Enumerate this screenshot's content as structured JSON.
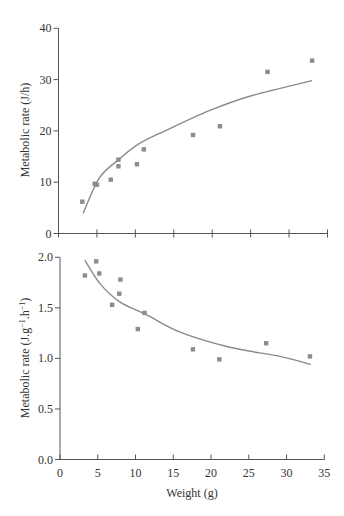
{
  "colors": {
    "axis": "#555555",
    "marker": "#8c8c8c",
    "curve": "#8a8a8a",
    "text": "#333333"
  },
  "chart_data": [
    {
      "type": "scatter",
      "panel": "top",
      "title": "",
      "xlabel": "",
      "ylabel": "Metabolic rate (J/h)",
      "xlim": [
        0,
        35
      ],
      "ylim": [
        0,
        40
      ],
      "xticks": [
        0,
        5,
        10,
        15,
        20,
        25,
        30,
        35
      ],
      "xtick_labels_shown": false,
      "yticks": [
        0,
        10,
        20,
        30,
        40
      ],
      "ytick_labels": [
        "0",
        "10",
        "20",
        "30",
        "40"
      ],
      "grid": false,
      "legend": null,
      "series": [
        {
          "name": "observed",
          "kind": "points",
          "x": [
            3.1,
            4.7,
            5.0,
            6.8,
            7.8,
            7.8,
            10.2,
            11.1,
            17.5,
            21.0,
            27.2,
            33.0
          ],
          "y": [
            6.2,
            9.7,
            9.5,
            10.5,
            14.4,
            13.1,
            13.5,
            16.4,
            19.2,
            20.9,
            31.5,
            33.7
          ]
        },
        {
          "name": "fitted curve",
          "kind": "line",
          "x": [
            3.2,
            5.3,
            7.9,
            10.5,
            14.0,
            19.7,
            25.0,
            33.0
          ],
          "y": [
            3.9,
            10.8,
            14.5,
            17.5,
            20.1,
            24.0,
            26.8,
            29.8
          ]
        }
      ]
    },
    {
      "type": "scatter",
      "panel": "bottom",
      "title": "",
      "xlabel": "Weight (g)",
      "ylabel": "Metabolic rate (J.g⁻¹.h⁻¹)",
      "ylabel_parts": {
        "pre": "Metabolic rate (J.g",
        "sup1": "−1",
        "mid": ".h",
        "sup2": "−1",
        "post": ")"
      },
      "xlim": [
        0,
        35
      ],
      "ylim": [
        0.0,
        2.0
      ],
      "xticks": [
        0,
        5,
        10,
        15,
        20,
        25,
        30,
        35
      ],
      "xtick_labels": [
        "0",
        "5",
        "10",
        "15",
        "20",
        "25",
        "30",
        "35"
      ],
      "yticks": [
        0.0,
        0.5,
        1.0,
        1.5,
        2.0
      ],
      "ytick_labels": [
        "0.0",
        "0.5",
        "1.0",
        "1.5",
        "2.0"
      ],
      "grid": false,
      "legend": null,
      "series": [
        {
          "name": "observed",
          "kind": "points",
          "x": [
            3.3,
            4.8,
            5.2,
            6.9,
            7.85,
            8.0,
            10.3,
            11.2,
            17.6,
            21.1,
            27.3,
            33.1
          ],
          "y": [
            1.82,
            1.96,
            1.84,
            1.53,
            1.64,
            1.78,
            1.29,
            1.45,
            1.09,
            0.99,
            1.15,
            1.02
          ]
        },
        {
          "name": "fitted curve",
          "kind": "line",
          "x": [
            3.3,
            5.3,
            7.9,
            11.5,
            15.9,
            22.5,
            29.1,
            33.2
          ],
          "y": [
            1.97,
            1.74,
            1.56,
            1.43,
            1.26,
            1.11,
            1.02,
            0.94
          ]
        }
      ]
    }
  ]
}
